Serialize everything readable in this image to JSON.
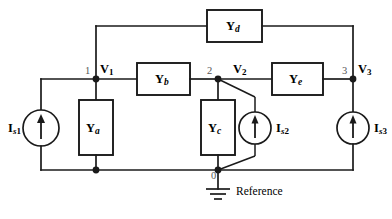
{
  "figure": {
    "kind": "circuit-diagram",
    "reference_label": "Reference",
    "stroke_color": "#1a1a1a",
    "background_color": "#ffffff"
  },
  "admittances": [
    {
      "id": "Ya",
      "symbol": "Y",
      "subscript": "a"
    },
    {
      "id": "Yb",
      "symbol": "Y",
      "subscript": "b"
    },
    {
      "id": "Yc",
      "symbol": "Y",
      "subscript": "c"
    },
    {
      "id": "Yd",
      "symbol": "Y",
      "subscript": "d"
    },
    {
      "id": "Ye",
      "symbol": "Y",
      "subscript": "e"
    }
  ],
  "sources": [
    {
      "id": "Is1",
      "symbol": "I",
      "subscript_italic": "s",
      "subscript_num": "1",
      "direction": "up"
    },
    {
      "id": "Is2",
      "symbol": "I",
      "subscript_italic": "s",
      "subscript_num": "2",
      "direction": "up"
    },
    {
      "id": "Is3",
      "symbol": "I",
      "subscript_italic": "s",
      "subscript_num": "3",
      "direction": "up"
    }
  ],
  "nodes": [
    {
      "number": "1",
      "voltage_symbol": "V",
      "voltage_subscript": "1"
    },
    {
      "number": "2",
      "voltage_symbol": "V",
      "voltage_subscript": "2"
    },
    {
      "number": "3",
      "voltage_symbol": "V",
      "voltage_subscript": "3"
    },
    {
      "number": "0",
      "voltage_symbol": "",
      "voltage_subscript": ""
    }
  ]
}
